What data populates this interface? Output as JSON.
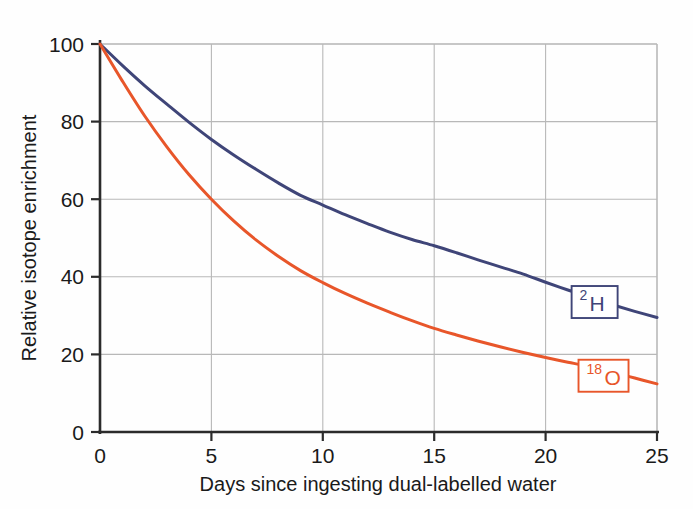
{
  "chart_data": {
    "type": "line",
    "title": "",
    "xlabel": "Days since ingesting dual-labelled water",
    "ylabel": "Relative isotope enrichment",
    "xlim": [
      0,
      25
    ],
    "ylim": [
      0,
      100
    ],
    "xticks": [
      "0",
      "5",
      "10",
      "15",
      "20",
      "25"
    ],
    "xtick_values": [
      0,
      5,
      10,
      15,
      20,
      25
    ],
    "yticks": [
      "0",
      "20",
      "40",
      "60",
      "80",
      "100"
    ],
    "ytick_values": [
      0,
      20,
      40,
      60,
      80,
      100
    ],
    "grid": true,
    "grid_color": "#b8b8b8",
    "legend_position": "inline-right",
    "x": [
      0,
      1,
      2,
      3,
      4,
      5,
      6,
      7,
      8,
      9,
      10,
      11,
      12,
      13,
      14,
      15,
      16,
      17,
      18,
      19,
      20,
      21,
      22,
      23,
      24,
      25
    ],
    "series": [
      {
        "name": "2H",
        "label_sup": "2",
        "label_main": "H",
        "color": "#3f4578",
        "values": [
          100,
          94.5,
          89.3,
          84.5,
          79.8,
          75.4,
          71.4,
          67.7,
          64.2,
          61.0,
          58.5,
          56.0,
          53.7,
          51.5,
          49.6,
          48.0,
          46.2,
          44.3,
          42.5,
          40.7,
          38.6,
          36.6,
          34.6,
          32.8,
          31.1,
          29.5
        ]
      },
      {
        "name": "18O",
        "label_sup": "18",
        "label_main": "O",
        "color": "#e8562a",
        "values": [
          100,
          90.5,
          81.5,
          73.5,
          66.3,
          60.0,
          54.4,
          49.5,
          45.3,
          41.6,
          38.5,
          35.7,
          33.2,
          30.9,
          28.7,
          26.7,
          25.0,
          23.4,
          21.9,
          20.5,
          19.2,
          18.0,
          16.8,
          15.4,
          13.9,
          12.4
        ]
      }
    ],
    "annotations": [
      {
        "series": "2H",
        "sup": "2",
        "main": "H",
        "at_x": 22.2,
        "at_y": 33.5,
        "box_color": "#3f4578"
      },
      {
        "series": "18O",
        "sup": "18",
        "main": "O",
        "at_x": 22.6,
        "at_y": 14.5,
        "box_color": "#e8562a"
      }
    ]
  },
  "axes": {
    "spine_color": "#2b2b2b",
    "frame_color": "#c9c9c9"
  }
}
